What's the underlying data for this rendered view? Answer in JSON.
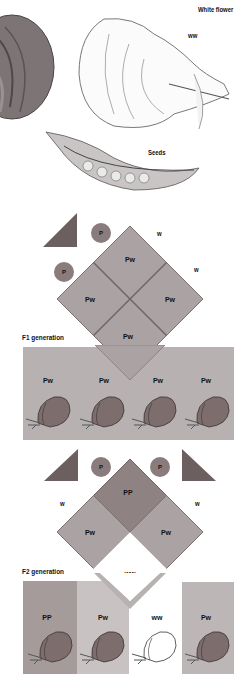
{
  "top": {
    "white_flower_label": "White flower",
    "white_genotype": "ww",
    "seeds_label": "Seeds"
  },
  "punnett1": {
    "gametes_left": [
      "P",
      "P"
    ],
    "gametes_right": [
      "w",
      "w"
    ],
    "cells": [
      "Pw",
      "Pw",
      "Pw",
      "Pw"
    ],
    "colors": {
      "cell": "#aba3a3",
      "border": "#7d7070",
      "triangle": "#6b5f5f",
      "gamete": "#8a7c7c"
    }
  },
  "f1": {
    "label": "F1 generation",
    "plants": [
      "Pw",
      "Pw",
      "Pw",
      "Pw"
    ],
    "bg": "#b8b1b1"
  },
  "punnett2": {
    "gametes_top": [
      "P",
      "P"
    ],
    "gametes_side": [
      "w",
      "w"
    ],
    "cells": {
      "top": "PP",
      "left": "Pw",
      "right": "Pw",
      "bottom": "ww"
    },
    "colors": {
      "dominant": "#8f8282",
      "hetero": "#aba3a3",
      "recessive": "#ffffff"
    }
  },
  "f2": {
    "label": "F2 generation",
    "plants": [
      "PP",
      "Pw",
      "ww",
      "Pw"
    ],
    "colors": [
      "#a59b9b",
      "#c9c2c2",
      "#ffffff",
      "#bdb6b6"
    ]
  }
}
